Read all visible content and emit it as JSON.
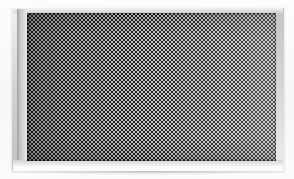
{
  "image": {
    "subject": "perforated metal grille panel",
    "description": "Close-up of a rectangular speaker/vent grille: a light gray beveled metal frame surrounding a dense dark perforated checkerboard mesh field.",
    "orientation": "landscape",
    "width_px": 294,
    "height_px": 179
  },
  "background": {
    "name": "background",
    "color": "#fefefe",
    "tint_bottom": "#f7f7f7"
  },
  "panel": {
    "name": "grille-panel",
    "left_px": 12,
    "top_px": 7,
    "width_px": 272,
    "height_px": 164,
    "frame_color_light": "#f2f2f2",
    "frame_color_mid": "#b9b9b9",
    "frame_color_dark": "#9e9e9e",
    "bevel_highlight": "#ffffff"
  },
  "mesh": {
    "name": "perforated-mesh",
    "left_px": 27,
    "top_px": 13,
    "width_px": 249,
    "height_px": 148,
    "pattern": "checkerboard",
    "cell_pitch_px": 4,
    "hole_color": "#1f1f1f",
    "web_color": "#bdbdbd",
    "base_color": "#a9a9a9",
    "approx_columns": 62,
    "approx_rows": 37,
    "lighting": "left-dark to right-bright gradient"
  },
  "accents": {
    "base_reflection_color": "#ffffff",
    "cast_shadow_color": "rgba(0,0,0,0.16)"
  }
}
